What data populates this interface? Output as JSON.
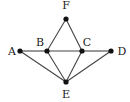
{
  "diagram": {
    "type": "graph",
    "nodes": [
      {
        "id": "A",
        "label": "A",
        "x": 20,
        "y": 51,
        "lx": 12,
        "ly": 55
      },
      {
        "id": "B",
        "label": "B",
        "x": 47,
        "y": 51,
        "lx": 40,
        "ly": 46
      },
      {
        "id": "C",
        "label": "C",
        "x": 82,
        "y": 51,
        "lx": 87,
        "ly": 46
      },
      {
        "id": "D",
        "label": "D",
        "x": 111,
        "y": 51,
        "lx": 122,
        "ly": 55
      },
      {
        "id": "E",
        "label": "E",
        "x": 66,
        "y": 82,
        "lx": 66,
        "ly": 98
      },
      {
        "id": "F",
        "label": "F",
        "x": 66,
        "y": 19,
        "lx": 66,
        "ly": 9
      }
    ],
    "edges": [
      [
        "A",
        "B"
      ],
      [
        "B",
        "C"
      ],
      [
        "C",
        "D"
      ],
      [
        "F",
        "B"
      ],
      [
        "F",
        "C"
      ],
      [
        "A",
        "E"
      ],
      [
        "B",
        "E"
      ],
      [
        "C",
        "E"
      ],
      [
        "D",
        "E"
      ]
    ],
    "colors": {
      "edge": "#444444",
      "node": "#111111",
      "label": "#222222"
    }
  }
}
